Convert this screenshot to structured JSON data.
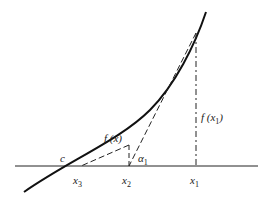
{
  "diagram": {
    "labels": {
      "c": "c",
      "x3": "x",
      "x3_sub": "3",
      "x2": "x",
      "x2_sub": "2",
      "x1": "x",
      "x1_sub": "1",
      "fx": "f (x)",
      "fx1_main": "f (x",
      "fx1_sub": "1",
      "fx1_close": ")",
      "alpha": "α",
      "alpha_sub": "1"
    },
    "colors": {
      "stroke": "#111111",
      "text": "#222222"
    }
  }
}
